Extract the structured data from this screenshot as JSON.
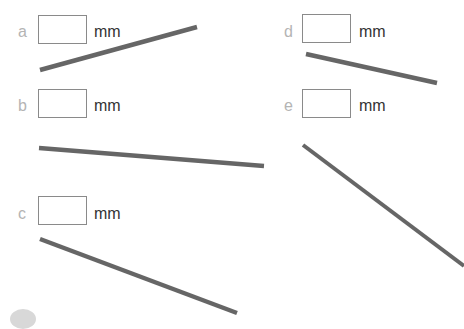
{
  "items": [
    {
      "letter": "a",
      "unit": "mm",
      "label_x": 18,
      "label_y": 24,
      "box_x": 38,
      "box_y": 15,
      "unit_x": 94,
      "unit_y": 24,
      "line": {
        "x1": 40,
        "y1": 70,
        "x2": 197,
        "y2": 27
      }
    },
    {
      "letter": "b",
      "unit": "mm",
      "label_x": 18,
      "label_y": 98,
      "box_x": 38,
      "box_y": 89,
      "unit_x": 94,
      "unit_y": 98,
      "line": {
        "x1": 39,
        "y1": 148,
        "x2": 264,
        "y2": 166
      }
    },
    {
      "letter": "c",
      "unit": "mm",
      "label_x": 18,
      "label_y": 207,
      "box_x": 38,
      "box_y": 196,
      "unit_x": 94,
      "unit_y": 206,
      "line": {
        "x1": 40,
        "y1": 239,
        "x2": 237,
        "y2": 313
      }
    },
    {
      "letter": "d",
      "unit": "mm",
      "label_x": 284,
      "label_y": 24,
      "box_x": 302,
      "box_y": 14,
      "unit_x": 359,
      "unit_y": 24,
      "line": {
        "x1": 306,
        "y1": 54,
        "x2": 437,
        "y2": 83
      }
    },
    {
      "letter": "e",
      "unit": "mm",
      "label_x": 284,
      "label_y": 98,
      "box_x": 302,
      "box_y": 89,
      "unit_x": 359,
      "unit_y": 98,
      "line": {
        "x1": 303,
        "y1": 145,
        "x2": 464,
        "y2": 266
      }
    }
  ],
  "colors": {
    "line": "#666666",
    "label": "#b4b4b4",
    "box_border": "#8a8a8a"
  }
}
